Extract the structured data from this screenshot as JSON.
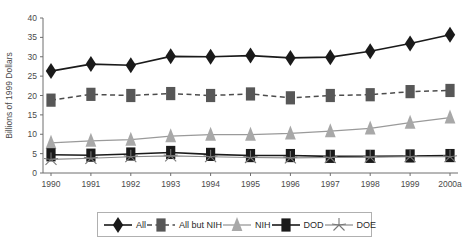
{
  "chart_data": {
    "type": "line",
    "title": "",
    "xlabel": "",
    "ylabel": "Billions of 1999 Dollars",
    "categories": [
      "1990",
      "1991",
      "1992",
      "1993",
      "1994",
      "1995",
      "1996",
      "1997",
      "1998",
      "1999",
      "2000a"
    ],
    "ylim": [
      0,
      40
    ],
    "yticks": [
      0,
      5,
      10,
      15,
      20,
      25,
      30,
      35,
      40
    ],
    "ytick_labels": [
      "0",
      "5",
      "10",
      "15",
      "20",
      "25",
      "30",
      "35",
      "40"
    ],
    "grid": false,
    "legend_position": "bottom",
    "series": [
      {
        "name": "All",
        "marker": "diamond",
        "line_style": "solid",
        "color": "#1a1a1a",
        "values": [
          26.3,
          28.1,
          27.8,
          30.1,
          30.0,
          30.3,
          29.7,
          29.9,
          31.4,
          33.4,
          35.7
        ]
      },
      {
        "name": "All but NIH",
        "marker": "square",
        "line_style": "dashed",
        "color": "#575757",
        "values": [
          18.8,
          20.3,
          20.0,
          20.5,
          20.0,
          20.4,
          19.4,
          20.0,
          20.2,
          21.0,
          21.3
        ]
      },
      {
        "name": "NIH",
        "marker": "triangle",
        "line_style": "solid",
        "color": "#a8a8a8",
        "values": [
          7.8,
          8.3,
          8.6,
          9.5,
          9.9,
          9.9,
          10.2,
          10.8,
          11.5,
          13.0,
          14.3
        ]
      },
      {
        "name": "DOD",
        "marker": "square",
        "line_style": "solid",
        "color": "#1a1a1a",
        "values": [
          4.7,
          4.6,
          4.9,
          5.3,
          4.8,
          4.5,
          4.5,
          4.3,
          4.3,
          4.4,
          4.5
        ]
      },
      {
        "name": "DOE",
        "marker": "asterisk",
        "line_style": "solid",
        "color": "#8a8a8a",
        "values": [
          3.5,
          3.8,
          4.2,
          4.4,
          4.2,
          4.0,
          3.9,
          4.0,
          4.1,
          4.2,
          4.2
        ]
      }
    ],
    "legend": [
      {
        "label": "All",
        "key": "diamond-dark-solid"
      },
      {
        "label": "All but NIH",
        "key": "square-gray-dashed"
      },
      {
        "label": "NIH",
        "key": "triangle-light-solid"
      },
      {
        "label": "DOD",
        "key": "square-dark-solid"
      },
      {
        "label": "DOE",
        "key": "asterisk-gray-solid"
      }
    ]
  }
}
